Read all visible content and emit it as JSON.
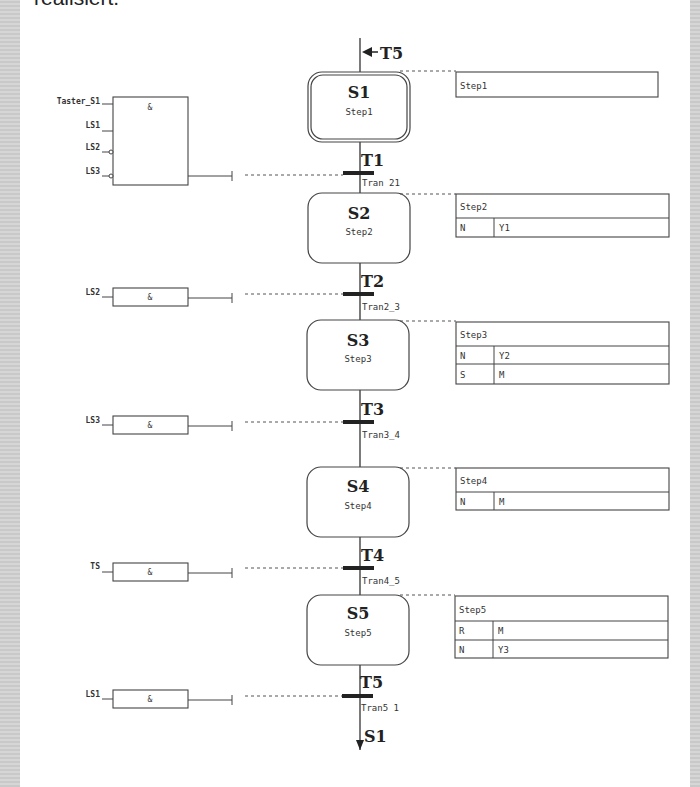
{
  "intro_text": "realisiert.",
  "colors": {
    "line": "#333333",
    "border_gray": "#cccccc",
    "background": "#ffffff"
  },
  "entry": {
    "arrow_label": "T5"
  },
  "exit": {
    "arrow_label": "S1"
  },
  "steps": [
    {
      "id": "S1",
      "name": "Step1",
      "initial": true,
      "action_block": {
        "title": "Step1",
        "actions": []
      }
    },
    {
      "id": "S2",
      "name": "Step2",
      "initial": false,
      "action_block": {
        "title": "Step2",
        "actions": [
          {
            "qualifier": "N",
            "variable": "Y1"
          }
        ]
      }
    },
    {
      "id": "S3",
      "name": "Step3",
      "initial": false,
      "action_block": {
        "title": "Step3",
        "actions": [
          {
            "qualifier": "N",
            "variable": "Y2"
          },
          {
            "qualifier": "S",
            "variable": "M"
          }
        ]
      }
    },
    {
      "id": "S4",
      "name": "Step4",
      "initial": false,
      "action_block": {
        "title": "Step4",
        "actions": [
          {
            "qualifier": "N",
            "variable": "M"
          }
        ]
      }
    },
    {
      "id": "S5",
      "name": "Step5",
      "initial": false,
      "action_block": {
        "title": "Step5",
        "actions": [
          {
            "qualifier": "R",
            "variable": "M"
          },
          {
            "qualifier": "N",
            "variable": "Y3"
          }
        ]
      }
    }
  ],
  "transitions": [
    {
      "id": "T1",
      "name": "Tran 21",
      "condition": {
        "operator": "&",
        "inputs": [
          {
            "name": "Taster_S1",
            "negated": false
          },
          {
            "name": "LS1",
            "negated": false
          },
          {
            "name": "LS2",
            "negated": true
          },
          {
            "name": "LS3",
            "negated": true
          }
        ]
      }
    },
    {
      "id": "T2",
      "name": "Tran2_3",
      "condition": {
        "operator": "&",
        "inputs": [
          {
            "name": "LS2",
            "negated": false
          }
        ]
      }
    },
    {
      "id": "T3",
      "name": "Tran3_4",
      "condition": {
        "operator": "&",
        "inputs": [
          {
            "name": "LS3",
            "negated": false
          }
        ]
      }
    },
    {
      "id": "T4",
      "name": "Tran4_5",
      "condition": {
        "operator": "&",
        "inputs": [
          {
            "name": "TS",
            "negated": false
          }
        ]
      }
    },
    {
      "id": "T5",
      "name": "Tran5 1",
      "condition": {
        "operator": "&",
        "inputs": [
          {
            "name": "LS1",
            "negated": false
          }
        ]
      }
    }
  ]
}
